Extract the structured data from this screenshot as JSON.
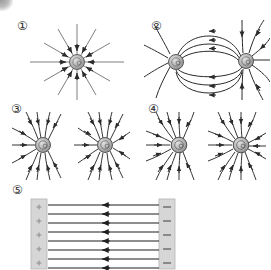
{
  "figure": {
    "background_color": "#ffffff",
    "line_color": "#2b2b2b",
    "charge_fill": "#b0b0b0",
    "charge_stroke": "#555555",
    "plate_fill": "#d4d4d4",
    "plate_stroke": "#9e9e9e",
    "width": 271,
    "height": 269
  },
  "panels": [
    {
      "id": "panel-1",
      "label": "①",
      "kind": "single-charge-radial",
      "charges": [
        {
          "sign": "-",
          "cx": 47,
          "cy": 40,
          "r": 7.5
        }
      ],
      "field_line_count": 12,
      "arrow_direction": "inward",
      "description": "Single point charge with twelve straight radial field lines, arrowheads pointing inward toward the charge."
    },
    {
      "id": "panel-2",
      "label": "②",
      "kind": "dipole",
      "charges": [
        {
          "sign": "-",
          "cx": 34,
          "cy": 46,
          "r": 7.5
        },
        {
          "sign": "+",
          "cx": 107,
          "cy": 46,
          "r": 7.5
        }
      ],
      "field_line_count": 12,
      "arrow_direction": "right-to-left",
      "description": "Two opposite charges; curved field lines arc from the right charge to the left charge, arrowheads pointing leftward."
    },
    {
      "id": "panel-3",
      "label": "③",
      "kind": "like-charges",
      "charges": [
        {
          "sign": "-",
          "cx": 32,
          "cy": 33,
          "r": 7.5
        },
        {
          "sign": "-",
          "cx": 94,
          "cy": 33,
          "r": 7.5
        }
      ],
      "field_line_count": 24,
      "arrow_direction": "inward",
      "description": "Two like charges side by side; field lines curve away from the midpoint with arrowheads pointing inward to each charge."
    },
    {
      "id": "panel-4",
      "label": "④",
      "kind": "like-charges-swirled",
      "charges": [
        {
          "sign": "-",
          "cx": 34,
          "cy": 33,
          "r": 7.5
        },
        {
          "sign": "-",
          "cx": 96,
          "cy": 33,
          "r": 7.5
        }
      ],
      "field_line_count": 24,
      "arrow_direction": "inward",
      "description": "Two like charges with strongly swirled curved field lines, arrowheads pointing inward to each charge."
    },
    {
      "id": "panel-5",
      "label": "⑤",
      "kind": "parallel-plate-capacitor",
      "left_plate": {
        "polarity": "+",
        "marks": 5,
        "x": 0,
        "y": 0,
        "width": 16,
        "height": 70
      },
      "right_plate": {
        "polarity": "−",
        "marks": 5,
        "x": 128,
        "y": 0,
        "width": 16,
        "height": 70
      },
      "field_line_count": 8,
      "arrow_direction": "leftward",
      "description": "Parallel plate capacitor: positively marked left plate, negatively marked right plate, eight horizontal uniform field lines with arrowheads pointing left."
    }
  ]
}
